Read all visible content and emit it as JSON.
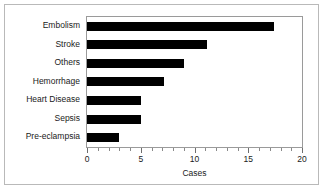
{
  "chart_data": {
    "type": "bar",
    "orientation": "horizontal",
    "title": "",
    "xlabel": "Cases",
    "ylabel": "",
    "categories": [
      "Embolism",
      "Stroke",
      "Others",
      "Hemorrhage",
      "Heart Disease",
      "Sepsis",
      "Pre-eclampsia"
    ],
    "values": [
      17.4,
      11.2,
      9,
      7.2,
      5,
      5,
      3
    ],
    "xlim": [
      0,
      20
    ],
    "xticks": [
      0,
      5,
      10,
      15,
      20
    ],
    "xtick_labels": [
      "0",
      "5",
      "10",
      "15",
      "20"
    ],
    "minor_tick_interval": 1,
    "grid": false,
    "legend": false,
    "bar_color": "#000000",
    "frame_color": "#9a9a9a",
    "border_color": "#b9b9b9",
    "background": "#ffffff"
  }
}
